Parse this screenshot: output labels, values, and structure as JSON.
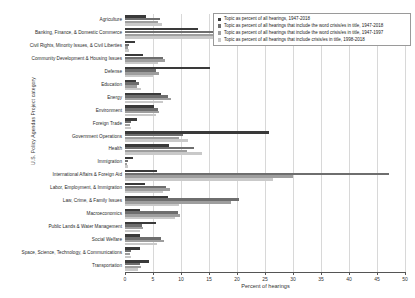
{
  "chart_data": {
    "type": "bar",
    "orientation": "horizontal",
    "title": "",
    "xlabel": "Percent of hearings",
    "ylabel": "U.S. Policy Agendas Project category",
    "xlim": [
      0,
      50
    ],
    "xticks": [
      0,
      5,
      10,
      15,
      20,
      25,
      30,
      35,
      40,
      45,
      50
    ],
    "grid": true,
    "legend_position": "top-right",
    "categories": [
      "Agriculture",
      "Banking, Finance, & Domestic Commerce",
      "Civil Rights, Minority Issues, & Civil Liberties",
      "Community Development & Housing Issues",
      "Defense",
      "Education",
      "Energy",
      "Environment",
      "Foreign Trade",
      "Government Operations",
      "Health",
      "Immigration",
      "International Affairs & Foreign Aid",
      "Labor, Employment, & Immigration",
      "Law, Crime, & Family Issues",
      "Macroeconomics",
      "Public Lands & Water Management",
      "Social Welfare",
      "Space, Science, Technology, & Communications",
      "Transportation"
    ],
    "series": [
      {
        "name": "Topic as percent of all hearings, 1947-2018",
        "color": "#3a3a3a",
        "values": [
          3.7,
          13.0,
          1.7,
          3.3,
          15.2,
          1.9,
          6.5,
          5.2,
          2.1,
          25.7,
          7.8,
          1.4,
          5.7,
          3.6,
          7.7,
          2.6,
          5.6,
          2.7,
          2.6,
          4.2
        ]
      },
      {
        "name": "Topic as percent of all hearings that include the word crisis/es in title, 1947-2018",
        "color": "#6e6e6e",
        "values": [
          6.2,
          27.0,
          0.7,
          6.8,
          5.5,
          2.5,
          7.6,
          5.9,
          1.0,
          10.3,
          12.3,
          0.5,
          47.2,
          7.4,
          20.4,
          9.5,
          3.0,
          6.4,
          1.0,
          2.6
        ]
      },
      {
        "name": "Topic as percent of all hearings that include the word crisis/es in title, 1947-1997",
        "color": "#9e9e9e",
        "values": [
          5.9,
          29.2,
          0.5,
          7.2,
          6.0,
          2.2,
          8.3,
          6.1,
          0.9,
          9.6,
          11.1,
          0.4,
          30.0,
          8.0,
          19.0,
          9.9,
          3.2,
          6.9,
          0.9,
          2.9
        ]
      },
      {
        "name": "Topic as percent of all hearings that include crisis/es in title, 1998-2018",
        "color": "#c9c9c9",
        "values": [
          6.6,
          31.0,
          0.8,
          5.9,
          5.0,
          2.8,
          6.8,
          5.5,
          1.1,
          11.2,
          13.8,
          0.6,
          26.5,
          6.7,
          9.7,
          9.0,
          2.7,
          5.8,
          1.1,
          2.3
        ]
      }
    ]
  },
  "legend": {
    "items": [
      "Topic as percent of all hearings, 1947-2018",
      "Topic as percent of all hearings that include the word crisis/es in title, 1947-2018",
      "Topic as percent of all hearings that include the word crisis/es in title, 1947-1997",
      "Topic as percent of all hearings that include crisis/es in title, 1998-2018"
    ]
  }
}
